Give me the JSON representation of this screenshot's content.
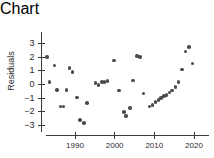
{
  "chart_data": {
    "type": "scatter",
    "title": "",
    "xlabel": "Year",
    "ylabel": "Residuals",
    "xlim": [
      1982,
      2022
    ],
    "ylim": [
      -3.4,
      3.4
    ],
    "grid": false,
    "legend": null,
    "xticks": [
      1990,
      2000,
      2010,
      2020
    ],
    "xtick_labels": [
      "1990",
      "2000",
      "2010",
      "2020"
    ],
    "yticks": [
      -3,
      -2,
      -1,
      0,
      1,
      2,
      3
    ],
    "ytick_labels": [
      "−3",
      "−2",
      "−1",
      "0",
      "1",
      "2",
      "3"
    ],
    "marker": "filled-circle",
    "marker_color": "#4a4a4f",
    "points": [
      {
        "x": 1983,
        "y": 2.0
      },
      {
        "x": 1983.6,
        "y": 0.2
      },
      {
        "x": 1984.8,
        "y": 1.4
      },
      {
        "x": 1985.4,
        "y": -0.4
      },
      {
        "x": 1986.3,
        "y": -1.6
      },
      {
        "x": 1987.1,
        "y": -1.6
      },
      {
        "x": 1987.9,
        "y": -0.4
      },
      {
        "x": 1988.6,
        "y": 1.2
      },
      {
        "x": 1989.4,
        "y": 0.9
      },
      {
        "x": 1990.5,
        "y": -0.95
      },
      {
        "x": 1991.3,
        "y": -2.6
      },
      {
        "x": 1992.2,
        "y": -2.8
      },
      {
        "x": 1993.0,
        "y": -1.35
      },
      {
        "x": 1995.2,
        "y": 0.1
      },
      {
        "x": 1995.9,
        "y": -0.05
      },
      {
        "x": 1996.8,
        "y": 0.2
      },
      {
        "x": 1997.4,
        "y": 0.2
      },
      {
        "x": 1998.2,
        "y": 0.25
      },
      {
        "x": 1999.9,
        "y": 1.75
      },
      {
        "x": 2001.1,
        "y": -0.45
      },
      {
        "x": 2002.3,
        "y": -2.0
      },
      {
        "x": 2002.9,
        "y": -2.3
      },
      {
        "x": 2003.8,
        "y": -1.7
      },
      {
        "x": 2004.6,
        "y": 0.3
      },
      {
        "x": 2005.6,
        "y": 2.1
      },
      {
        "x": 2006.4,
        "y": 2.0
      },
      {
        "x": 2007.3,
        "y": -0.65
      },
      {
        "x": 2008.8,
        "y": -1.6
      },
      {
        "x": 2009.5,
        "y": -1.5
      },
      {
        "x": 2010.3,
        "y": -1.3
      },
      {
        "x": 2011.0,
        "y": -1.15
      },
      {
        "x": 2011.7,
        "y": -1.0
      },
      {
        "x": 2012.4,
        "y": -0.85
      },
      {
        "x": 2013.1,
        "y": -0.75
      },
      {
        "x": 2013.8,
        "y": -0.6
      },
      {
        "x": 2014.5,
        "y": -0.45
      },
      {
        "x": 2015.3,
        "y": -0.2
      },
      {
        "x": 2016.1,
        "y": 0.2
      },
      {
        "x": 2017.0,
        "y": 1.1
      },
      {
        "x": 2017.9,
        "y": 2.4
      },
      {
        "x": 2018.8,
        "y": 2.75
      },
      {
        "x": 2019.6,
        "y": 1.55
      }
    ]
  }
}
